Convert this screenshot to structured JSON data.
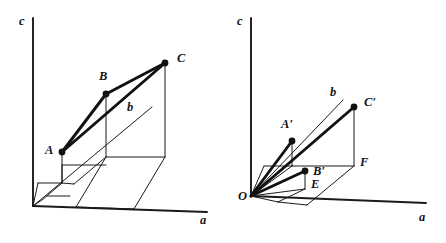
{
  "figure": {
    "background_color": "#ffffff",
    "ink_color": "#111111",
    "width": 446,
    "height": 243
  },
  "panels": [
    {
      "id": "left",
      "name": "vectors-from-displaced-origin",
      "axes": [
        {
          "name": "c-axis",
          "label": "c",
          "label_x": 19,
          "label_y": 15,
          "x1": 33,
          "y1": 18,
          "x2": 33,
          "y2": 206
        },
        {
          "name": "a-axis",
          "label": "a",
          "label_x": 200,
          "label_y": 214,
          "x1": 33,
          "y1": 206,
          "x2": 207,
          "y2": 212
        },
        {
          "name": "b-axis",
          "label": "b",
          "label_x": 127,
          "label_y": 101,
          "x1": 33,
          "y1": 206,
          "x2": 152,
          "y2": 107
        }
      ],
      "points": [
        {
          "name": "point-A",
          "label": "A",
          "x": 62,
          "y": 152,
          "label_x": 45,
          "label_y": 144
        },
        {
          "name": "point-B",
          "label": "B",
          "x": 106,
          "y": 94,
          "label_x": 99,
          "label_y": 70
        },
        {
          "name": "point-C",
          "label": "C",
          "x": 165,
          "y": 63,
          "label_x": 177,
          "label_y": 52
        }
      ],
      "vectors": [
        {
          "name": "vector-A-to-B",
          "from": "A",
          "to": "B"
        },
        {
          "name": "vector-B-to-C",
          "from": "B",
          "to": "C"
        },
        {
          "name": "vector-A-to-C",
          "from": "A",
          "to": "C"
        }
      ]
    },
    {
      "id": "right",
      "name": "vectors-from-common-origin",
      "axes": [
        {
          "name": "c-axis",
          "label": "c",
          "label_x": 237,
          "label_y": 15,
          "x1": 251,
          "y1": 18,
          "x2": 251,
          "y2": 196
        },
        {
          "name": "a-axis",
          "label": "a",
          "label_x": 419,
          "label_y": 211,
          "x1": 251,
          "y1": 196,
          "x2": 426,
          "y2": 203
        },
        {
          "name": "b-axis",
          "label": "b",
          "label_x": 330,
          "label_y": 86,
          "x1": 251,
          "y1": 196,
          "x2": 343,
          "y2": 100
        }
      ],
      "points": [
        {
          "name": "origin-O",
          "label": "O",
          "x": 251,
          "y": 196,
          "label_x": 238,
          "label_y": 190
        },
        {
          "name": "point-A-prime",
          "label": "A′",
          "x": 292,
          "y": 141,
          "label_x": 281,
          "label_y": 118
        },
        {
          "name": "point-B-prime",
          "label": "B′",
          "x": 305,
          "y": 171,
          "label_x": 313,
          "label_y": 165
        },
        {
          "name": "point-C-prime",
          "label": "C′",
          "x": 354,
          "y": 107,
          "label_x": 364,
          "label_y": 96
        },
        {
          "name": "point-E",
          "label": "E",
          "x": 305,
          "y": 189,
          "label_x": 311,
          "label_y": 178
        },
        {
          "name": "point-F",
          "label": "F",
          "x": 354,
          "y": 166,
          "label_x": 360,
          "label_y": 156
        }
      ],
      "vectors": [
        {
          "name": "vector-O-to-A-prime",
          "from": "O",
          "to": "A′"
        },
        {
          "name": "vector-O-to-B-prime",
          "from": "O",
          "to": "B′"
        },
        {
          "name": "vector-O-to-C-prime",
          "from": "O",
          "to": "C′"
        }
      ]
    }
  ]
}
